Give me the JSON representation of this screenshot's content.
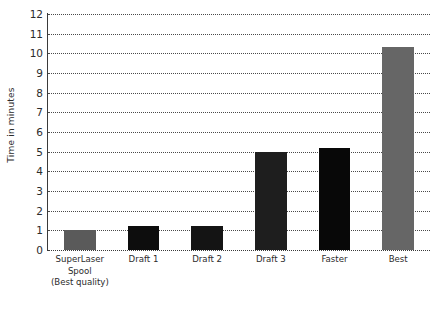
{
  "chart_data": {
    "type": "bar",
    "title": "",
    "xlabel": "",
    "ylabel": "Time in minutes",
    "ylim": [
      0,
      12
    ],
    "ytick_step": 1,
    "grid": true,
    "legend": "none",
    "categories": [
      "SuperLaser Spool (Best quality)",
      "Draft 1",
      "Draft 2",
      "Draft 3",
      "Faster",
      "Best"
    ],
    "category_lines": [
      [
        "SuperLaser",
        "Spool",
        "(Best quality)"
      ],
      [
        "Draft 1"
      ],
      [
        "Draft 2"
      ],
      [
        "Draft 3"
      ],
      [
        "Faster"
      ],
      [
        "Best"
      ]
    ],
    "values": [
      1.0,
      1.2,
      1.2,
      5.0,
      5.2,
      10.3
    ],
    "bar_colors": [
      "#5a5a5a",
      "#0d0d0d",
      "#141414",
      "#1e1e1e",
      "#080808",
      "#666666"
    ],
    "ytick_labels": [
      "0",
      "1",
      "2",
      "3",
      "4",
      "5",
      "6",
      "7",
      "8",
      "9",
      "10",
      "11",
      "12"
    ]
  },
  "axis": {
    "line_color": "#3a3a3a",
    "grid_color": "#4a4a4a",
    "text_color": "#2b2b2b"
  },
  "figure": {
    "background": "#ffffff"
  }
}
